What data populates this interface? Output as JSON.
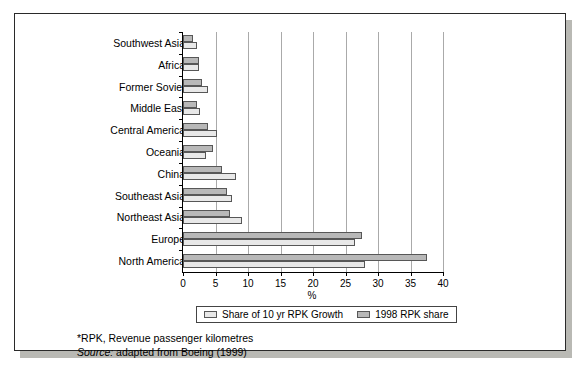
{
  "chart_data": {
    "type": "bar",
    "orientation": "horizontal",
    "title": "",
    "xlabel": "%",
    "ylabel": "",
    "xlim": [
      0,
      40
    ],
    "xticks": [
      0,
      5,
      10,
      15,
      20,
      25,
      30,
      35,
      40
    ],
    "grid": true,
    "legend_position": "bottom",
    "categories": [
      "Southwest Asia",
      "Africa",
      "Former Soviet",
      "Middle East",
      "Central America",
      "Oceania",
      "China",
      "Southeast Asia",
      "Northeast Asia",
      "Europe",
      "North America"
    ],
    "series": [
      {
        "name": "Share of 10 yr RPK Growth",
        "color": "#e8e8e8",
        "values": [
          2.2,
          2.5,
          3.9,
          2.6,
          5.3,
          3.6,
          8.1,
          7.6,
          9.1,
          26.5,
          28.0
        ]
      },
      {
        "name": "1998 RPK share",
        "color": "#b8b8b8",
        "values": [
          1.5,
          2.4,
          2.9,
          2.2,
          3.8,
          4.6,
          6.0,
          6.7,
          7.2,
          27.5,
          37.5
        ]
      }
    ]
  },
  "legend": {
    "items": [
      {
        "label": "Share of 10 yr RPK Growth"
      },
      {
        "label": "1998 RPK share"
      }
    ]
  },
  "notes": {
    "footnote": "*RPK, Revenue passenger kilometres",
    "source_label": "Source:",
    "source_text": " adapted from Boeing (1999)"
  }
}
